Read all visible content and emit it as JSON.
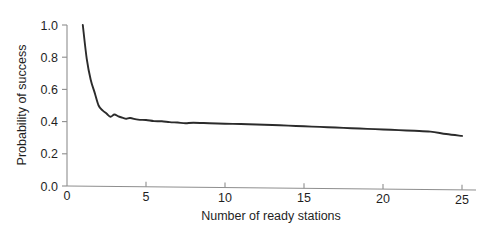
{
  "chart_data": {
    "type": "line",
    "title": "",
    "subtitle": "",
    "xlabel": "Number of ready stations",
    "ylabel": "Probability of success",
    "xlim": [
      0,
      26
    ],
    "ylim": [
      0.0,
      1.0
    ],
    "xticks": [
      0,
      5,
      10,
      15,
      20,
      25
    ],
    "xtick_labels": [
      "0",
      "5",
      "10",
      "15",
      "20",
      "25"
    ],
    "yticks": [
      0.0,
      0.2,
      0.4,
      0.6,
      0.8,
      1.0
    ],
    "ytick_labels": [
      "0.0",
      "0.2",
      "0.4",
      "0.6",
      "0.8",
      "1.0"
    ],
    "grid": false,
    "legend": false,
    "legend_position": "none",
    "annotations": [],
    "series": [
      {
        "name": "Probability of success",
        "color": "#2b2b2b",
        "x": [
          1,
          1.25,
          1.5,
          1.75,
          2,
          2.25,
          2.5,
          2.75,
          3,
          3.25,
          3.5,
          3.75,
          4,
          4.5,
          5,
          5.5,
          6,
          6.5,
          7,
          7.5,
          8,
          9,
          10,
          11,
          12,
          13,
          14,
          15,
          16,
          17,
          18,
          19,
          20,
          21,
          22,
          23,
          24,
          25
        ],
        "y": [
          1.0,
          0.79,
          0.66,
          0.58,
          0.5,
          0.47,
          0.45,
          0.43,
          0.444,
          0.432,
          0.425,
          0.418,
          0.422,
          0.412,
          0.41,
          0.403,
          0.402,
          0.397,
          0.394,
          0.39,
          0.393,
          0.39,
          0.387,
          0.385,
          0.382,
          0.379,
          0.375,
          0.371,
          0.367,
          0.363,
          0.359,
          0.355,
          0.351,
          0.347,
          0.343,
          0.338,
          0.323,
          0.311
        ]
      }
    ]
  },
  "axes": {
    "x_axis_name": "x-axis",
    "y_axis_name": "y-axis"
  }
}
